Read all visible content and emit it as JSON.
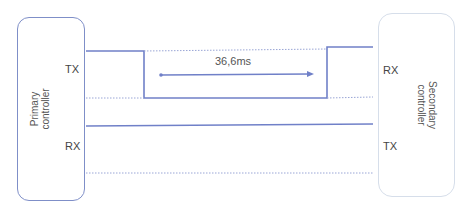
{
  "diagram": {
    "primary": {
      "name_line1": "Primary",
      "name_line2": "controller",
      "pin_tx": "TX",
      "pin_rx": "RX"
    },
    "secondary": {
      "name_line1": "Secondary",
      "name_line2": "controller",
      "pin_rx": "RX",
      "pin_tx": "TX"
    },
    "timing_label": "36,6ms",
    "colors": {
      "signal": "#7080c8",
      "dotted": "#9aa6d6",
      "primary_border": "#7f8fc8",
      "secondary_border": "#d6deea"
    }
  }
}
